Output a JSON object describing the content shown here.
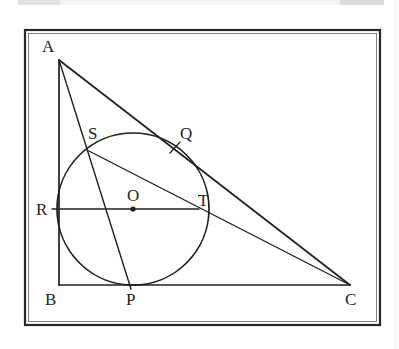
{
  "figure": {
    "type": "geometry-diagram",
    "frame": {
      "stroke_color": "#2b2623",
      "x": 25,
      "y": 30,
      "width": 355,
      "height": 295
    },
    "background_color": "#ffffff",
    "ink_color": "#231f1c",
    "points": [
      {
        "id": "A",
        "label": "A",
        "x": 59,
        "y": 60,
        "label_x": 42,
        "label_y": 52,
        "role": "triangle-vertex"
      },
      {
        "id": "B",
        "label": "B",
        "x": 59,
        "y": 285,
        "label_x": 45,
        "label_y": 305,
        "role": "triangle-vertex"
      },
      {
        "id": "C",
        "label": "C",
        "x": 350,
        "y": 285,
        "label_x": 345,
        "label_y": 305,
        "role": "triangle-vertex"
      },
      {
        "id": "O",
        "label": "O",
        "x": 133,
        "y": 209,
        "label_x": 127,
        "label_y": 200,
        "role": "circle-center"
      },
      {
        "id": "P",
        "label": "P",
        "x": 131,
        "y": 285,
        "label_x": 126,
        "label_y": 305,
        "role": "tangency-point"
      },
      {
        "id": "R",
        "label": "R",
        "x": 57,
        "y": 209,
        "label_x": 38,
        "label_y": 214,
        "role": "tangency-point"
      },
      {
        "id": "T",
        "label": "T",
        "x": 193,
        "y": 209,
        "label_x": 198,
        "label_y": 205,
        "role": "tangency-point"
      },
      {
        "id": "S",
        "label": "S",
        "x": 87,
        "y": 150,
        "label_x": 89,
        "label_y": 138,
        "role": "intersection-point"
      },
      {
        "id": "Q",
        "label": "Q",
        "x": 178,
        "y": 152,
        "label_x": 181,
        "label_y": 138,
        "role": "intersection-point"
      }
    ],
    "circle": {
      "center_x": 133,
      "center_y": 209,
      "radius": 76,
      "label": "incircle O"
    },
    "segments": [
      {
        "id": "AB",
        "label": "AB",
        "from": "A",
        "to": "B"
      },
      {
        "id": "BC",
        "label": "BC",
        "from": "B",
        "to": "C"
      },
      {
        "id": "AC",
        "label": "AC",
        "from": "A",
        "to": "C"
      },
      {
        "id": "AP",
        "label": "AP",
        "from": "A",
        "to": "P"
      },
      {
        "id": "RT",
        "label": "RT",
        "from": "R",
        "to": "T"
      },
      {
        "id": "SC",
        "label": "SC",
        "from": "S",
        "to": "C"
      }
    ],
    "tick_marks": [
      {
        "id": "tick-Q",
        "label": "tick at Q",
        "x1": 170,
        "y1": 152,
        "x2": 180,
        "y2": 142
      }
    ]
  }
}
